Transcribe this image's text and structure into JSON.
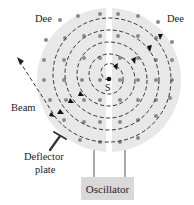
{
  "labels": {
    "dee_left": "Dee",
    "dee_right": "Dee",
    "source": "S",
    "beam": "Beam",
    "deflector_line1": "Deflector",
    "deflector_line2": "plate",
    "oscillator": "Oscillator"
  },
  "colors": {
    "dee_fill": "#e8e8e8",
    "gap": "#ffffff",
    "path": "#333333",
    "field_dot": "#8a8a8a",
    "oscillator_fill": "#d9d9d9"
  },
  "diagram": {
    "elements": [
      "two dees",
      "spiral particle path",
      "magnetic field dots",
      "source S",
      "beam exit",
      "deflector plate",
      "oscillator"
    ]
  }
}
